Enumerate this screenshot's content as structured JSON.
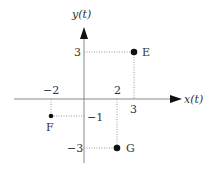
{
  "diagram": {
    "type": "coordinate-plane",
    "axes": {
      "x_label": "x(t)",
      "y_label": "y(t)"
    },
    "colors": {
      "axis": "#888888",
      "arrow": "#111111",
      "guide": "#999999",
      "point": "#111111",
      "text": "#333333"
    },
    "tick_labels": {
      "x_neg2": "−2",
      "x_2": "2",
      "x_3": "3",
      "y_3": "3",
      "y_neg1": "−1",
      "y_neg3": "−3"
    },
    "points": [
      {
        "label": "E",
        "x": 3,
        "y": 3
      },
      {
        "label": "F",
        "x": -2,
        "y": -1
      },
      {
        "label": "G",
        "x": 2,
        "y": -3
      }
    ]
  }
}
